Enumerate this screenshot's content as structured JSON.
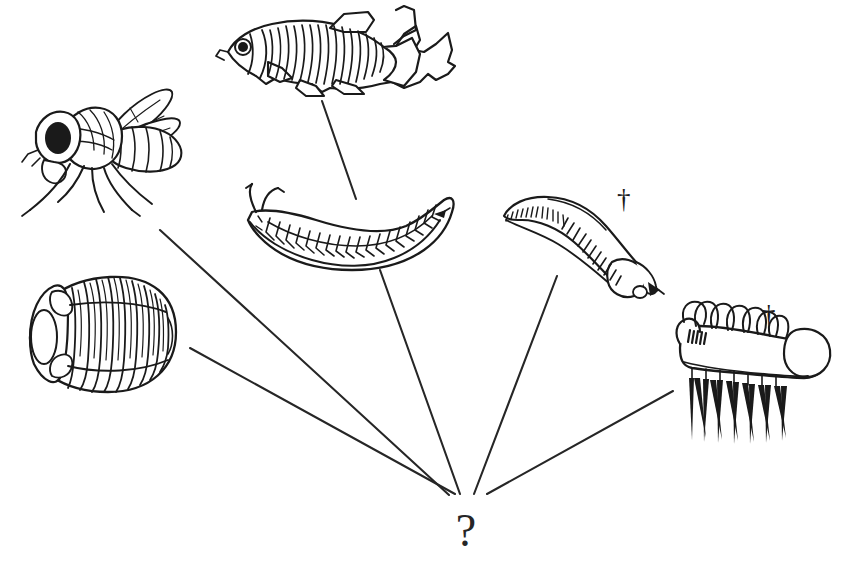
{
  "figure": {
    "type": "phylogenetic-diagram",
    "title": "",
    "background_color": "#ffffff",
    "ink_color": "#1a1a1a",
    "branch_color": "#262626",
    "ancestor_node": {
      "label": "?",
      "name": "unknown-common-ancestor",
      "x": 466,
      "y": 540
    },
    "convergence_point": {
      "x": 466,
      "y": 497
    },
    "extinct_marker": "†",
    "taxa": [
      {
        "id": "zebrafish",
        "common_name": "zebrafish",
        "icon": "zebrafish-icon",
        "extinct": false,
        "marker": "",
        "branch": {
          "x1": 322,
          "y1": 101,
          "x2": 356,
          "y2": 199
        }
      },
      {
        "id": "fruitfly",
        "common_name": "fruit fly",
        "icon": "fruitfly-icon",
        "extinct": false,
        "marker": "",
        "branch": {
          "x1": 160,
          "y1": 230,
          "x2": 449,
          "y2": 495
        }
      },
      {
        "id": "trilobite",
        "common_name": "trilobite",
        "icon": "trilobite-icon",
        "extinct": false,
        "marker": "",
        "branch": {
          "x1": 190,
          "y1": 348,
          "x2": 455,
          "y2": 494
        }
      },
      {
        "id": "annelid-worm",
        "common_name": "annelid worm",
        "icon": "annelid-worm-icon",
        "extinct": false,
        "marker": "",
        "branch": {
          "x1": 380,
          "y1": 270,
          "x2": 460,
          "y2": 494
        }
      },
      {
        "id": "priapulid-worm",
        "common_name": "priapulid worm",
        "icon": "priapulid-worm-icon",
        "extinct": true,
        "marker": "†",
        "branch": {
          "x1": 557,
          "y1": 276,
          "x2": 474,
          "y2": 494
        }
      },
      {
        "id": "hallucigenia",
        "common_name": "hallucigenia",
        "icon": "hallucigenia-icon",
        "extinct": true,
        "marker": "†",
        "branch": {
          "x1": 673,
          "y1": 391,
          "x2": 487,
          "y2": 494
        }
      }
    ]
  }
}
